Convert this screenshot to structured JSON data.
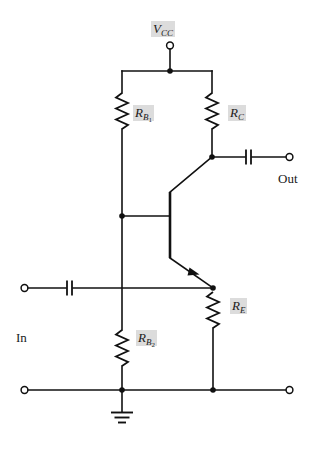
{
  "diagram": {
    "type": "circuit-schematic",
    "background_color": "#ffffff",
    "wire_color": "#111111",
    "label_highlight_color": "#dcdcdc"
  },
  "labels": {
    "vcc": {
      "symbol": "V",
      "subscript": "CC",
      "text": "VCC"
    },
    "rb1": {
      "symbol": "R",
      "subscript": "B",
      "subsubscript": "1",
      "text": "RB1"
    },
    "rc": {
      "symbol": "R",
      "subscript": "C",
      "text": "RC"
    },
    "re": {
      "symbol": "R",
      "subscript": "E",
      "text": "RE"
    },
    "rb2": {
      "symbol": "R",
      "subscript": "B",
      "subsubscript": "2",
      "text": "RB2"
    },
    "in": {
      "text": "In"
    },
    "out": {
      "text": "Out"
    }
  },
  "components": [
    {
      "id": "rb1",
      "kind": "resistor",
      "orientation": "vertical",
      "label": "RB1"
    },
    {
      "id": "rc",
      "kind": "resistor",
      "orientation": "vertical",
      "label": "RC"
    },
    {
      "id": "rb2",
      "kind": "resistor",
      "orientation": "vertical",
      "label": "RB2"
    },
    {
      "id": "re",
      "kind": "resistor",
      "orientation": "vertical",
      "label": "RE"
    },
    {
      "id": "q1",
      "kind": "transistor-npn",
      "orientation": "vertical",
      "label": ""
    },
    {
      "id": "cin",
      "kind": "capacitor",
      "orientation": "horizontal",
      "label": ""
    },
    {
      "id": "cout",
      "kind": "capacitor",
      "orientation": "horizontal",
      "label": ""
    },
    {
      "id": "gnd",
      "kind": "ground",
      "orientation": "vertical",
      "label": ""
    }
  ],
  "terminals": [
    {
      "id": "vcc-terminal",
      "style": "open-circle",
      "label": "VCC"
    },
    {
      "id": "in-terminal",
      "style": "open-circle",
      "label": "In"
    },
    {
      "id": "out-terminal",
      "style": "open-circle",
      "label": "Out"
    },
    {
      "id": "in-return-terminal",
      "style": "open-circle",
      "label": ""
    },
    {
      "id": "out-return-terminal",
      "style": "open-circle",
      "label": ""
    }
  ],
  "nodes": [
    {
      "id": "vcc-node",
      "style": "filled-dot"
    },
    {
      "id": "base-node",
      "style": "filled-dot"
    },
    {
      "id": "collector-node",
      "style": "filled-dot"
    },
    {
      "id": "emitter-node",
      "style": "filled-dot"
    },
    {
      "id": "ground-node",
      "style": "filled-dot"
    },
    {
      "id": "emitter-return-node",
      "style": "filled-dot"
    }
  ]
}
